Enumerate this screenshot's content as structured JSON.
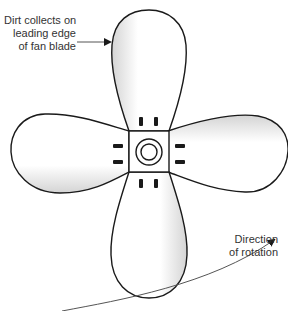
{
  "diagram": {
    "annotations": {
      "dirt": {
        "line1": "Dirt collects on",
        "line2": "leading edge",
        "line3": "of fan blade"
      },
      "rotation": {
        "line1": "Direction",
        "line2": "of rotation"
      }
    },
    "components": [
      "top-blade",
      "right-blade",
      "bottom-blade",
      "left-blade",
      "hub",
      "bolts",
      "rotation-arrow"
    ],
    "colors": {
      "stroke": "#1a1a1a",
      "blade_fill": "#ffffff",
      "blade_shade": "#d8d8d8",
      "text": "#333333"
    }
  }
}
